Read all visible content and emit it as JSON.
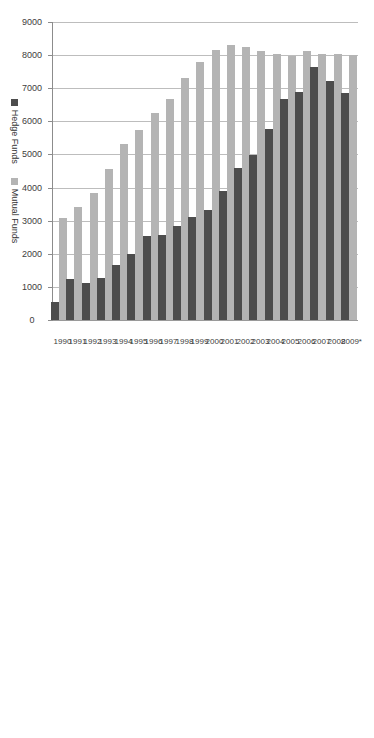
{
  "chart_data": {
    "type": "bar",
    "orientation": "vertical-rotated",
    "title": "",
    "xlabel": "",
    "ylabel": "",
    "ylim": [
      0,
      9000
    ],
    "ytick_step": 1000,
    "grid": true,
    "legend_position": "bottom",
    "categories": [
      "1990",
      "1991",
      "1992",
      "1993",
      "1994",
      "1995",
      "1996",
      "1997",
      "1998",
      "1999",
      "2000",
      "2001",
      "2002",
      "2003",
      "2004",
      "2005",
      "2006",
      "2007",
      "2008",
      "2009*"
    ],
    "yticks": [
      "0",
      "1000",
      "2000",
      "3000",
      "4000",
      "5000",
      "6000",
      "7000",
      "8000",
      "9000"
    ],
    "series": [
      {
        "name": "Hedge Funds",
        "color": "#4d4d4d",
        "values": [
          530,
          1230,
          1105,
          1277,
          1654,
          2006,
          2523,
          2563,
          2848,
          3102,
          3335,
          3904,
          4598,
          4998,
          5782,
          6665,
          6900,
          7634,
          7233,
          6845
        ]
      },
      {
        "name": "Mutual Funds",
        "color": "#b4b4b4",
        "values": [
          3079,
          3403,
          3824,
          4558,
          5325,
          5725,
          6248,
          6684,
          7314,
          7791,
          8155,
          8307,
          8256,
          8126,
          8041,
          7977,
          8117,
          8029,
          8022,
          7999
        ]
      }
    ]
  },
  "legend": {
    "items": [
      {
        "label": "Hedge Funds",
        "color": "#4d4d4d"
      },
      {
        "label": "Mutual Funds",
        "color": "#b4b4b4"
      }
    ]
  }
}
